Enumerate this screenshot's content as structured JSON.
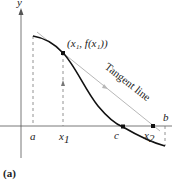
{
  "figure": {
    "caption": "(a)",
    "axes": {
      "y_label": "y"
    },
    "labels": {
      "a": "a",
      "x1": "x",
      "x1_sub": "1",
      "c": "c",
      "x2": "x",
      "x2_sub": "2",
      "b": "b",
      "point_label": "(x₁, f(x₁))",
      "tangent_label": "Tangent line"
    },
    "colors": {
      "curve": "#111111",
      "tangent": "#b8b8b8",
      "axis": "#555555",
      "dashed": "#777777"
    }
  }
}
